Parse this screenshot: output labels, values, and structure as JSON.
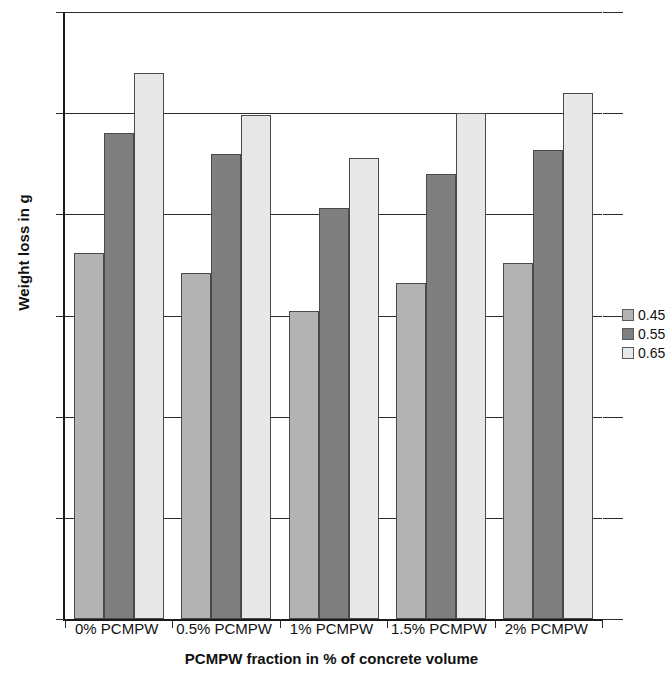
{
  "chart_data": {
    "type": "bar",
    "title": "",
    "subtitle": "",
    "xlabel": "PCMPW fraction in % of concrete volume",
    "ylabel": "Weight loss in g",
    "categories": [
      "0% PCMPW",
      "0.5% PCMPW",
      "1% PCMPW",
      "1.5% PCMPW",
      "2% PCMPW"
    ],
    "series": [
      {
        "name": "0.45",
        "color": "#b3b3b3",
        "values": [
          181,
          171,
          152,
          166,
          176
        ]
      },
      {
        "name": "0.55",
        "color": "#7f7f7f",
        "values": [
          240,
          230,
          203,
          220,
          232
        ]
      },
      {
        "name": "0.65",
        "color": "#e8e8e8",
        "values": [
          270,
          249,
          228,
          250,
          260
        ]
      }
    ],
    "ylim": [
      0,
      300
    ],
    "ytick_labels": [
      "300",
      "250",
      "200",
      "150",
      "100",
      "50",
      "0"
    ],
    "ytick_values": [
      300,
      250,
      200,
      150,
      100,
      50,
      0
    ],
    "grid": true,
    "grid_axis": "y",
    "legend_position": "right",
    "legend_entries": [
      "0.45",
      "0.55",
      "0.65"
    ],
    "axis_color": "#2b2b2b",
    "background": "#ffffff"
  }
}
